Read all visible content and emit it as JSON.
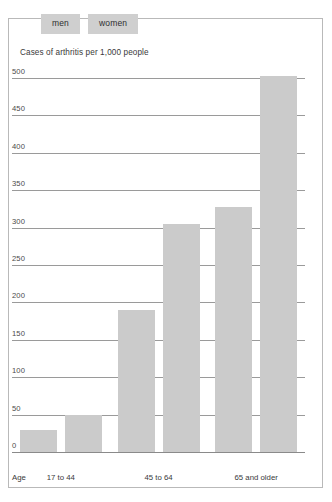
{
  "legend": {
    "items": [
      {
        "label": "men",
        "color": "#cbcbcb"
      },
      {
        "label": "women",
        "color": "#cbcbcb"
      }
    ],
    "swatch_bg": "#cfcfcf"
  },
  "subtitle": "Cases of arthritis per 1,000 people",
  "axis": {
    "x_title": "Age"
  },
  "chart_data": {
    "type": "bar",
    "title": "",
    "subtitle": "Cases of arthritis per 1,000 people",
    "xlabel": "Age",
    "ylabel": "Cases of arthritis per 1,000 people",
    "categories": [
      "17 to 44",
      "45 to 64",
      "65 and older"
    ],
    "series": [
      {
        "name": "men",
        "values": [
          30,
          190,
          328
        ],
        "color": "#cbcbcb"
      },
      {
        "name": "women",
        "values": [
          50,
          305,
          503
        ],
        "color": "#cbcbcb"
      }
    ],
    "ylim": [
      0,
      500
    ],
    "ytick_step": 50,
    "yticks": [
      0,
      50,
      100,
      150,
      200,
      250,
      300,
      350,
      400,
      450,
      500
    ],
    "ytick_labels": [
      "0",
      "50",
      "100",
      "150",
      "200",
      "250",
      "300",
      "350",
      "400",
      "450",
      "500"
    ],
    "grid": true,
    "grid_axis": "y",
    "legend_position": "top-left",
    "background": "#ffffff",
    "gridline_color": "#9a9a9a"
  }
}
